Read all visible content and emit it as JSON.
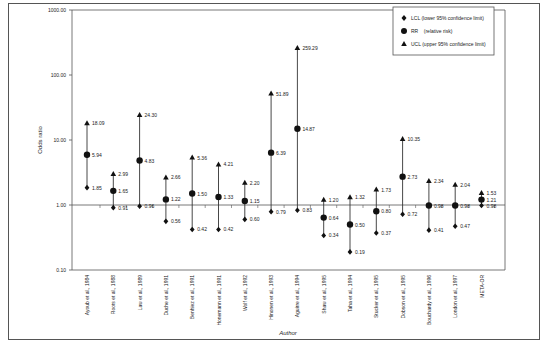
{
  "chart_data": {
    "type": "scatter",
    "subtype": "forest-plot (odds ratio with 95% CI)",
    "title": "",
    "xlabel": "Author",
    "ylabel": "Odds ratio",
    "yscale": "log",
    "ylim": [
      0.1,
      1000
    ],
    "yticks": [
      "0.10",
      "1.00",
      "10.00",
      "100.00",
      "1000.00"
    ],
    "legend": {
      "position": "top-right",
      "entries": [
        {
          "marker": "diamond",
          "label": "LCL (lower 95% confidence limit)"
        },
        {
          "marker": "circle",
          "label": "RR    (relative risk)"
        },
        {
          "marker": "triangle",
          "label": "UCL (upper 95% confidence limit)"
        }
      ]
    },
    "categories": [
      "Ayoub et al., 1984",
      "Roots et al., 1988",
      "Law et al., 1989",
      "Duche et al., 1991",
      "Benhiez et al., 1991",
      "Honemann et al., 1991",
      "Wolf et al., 1992",
      "Hinonen et al., 1993",
      "Aguirre et al., 1994",
      "Shaw et al., 1995",
      "Taha et al., 1994",
      "Stucker et al., 1995",
      "Dobson et al., 1995",
      "Bouchardy et al., 1996",
      "London et al., 1997",
      "META-OR"
    ],
    "series": [
      {
        "name": "LCL",
        "values": [
          1.85,
          0.91,
          0.96,
          0.56,
          0.42,
          0.42,
          0.6,
          0.79,
          0.83,
          0.34,
          0.19,
          0.37,
          0.72,
          0.41,
          0.47,
          0.98
        ]
      },
      {
        "name": "RR",
        "values": [
          5.94,
          1.65,
          4.83,
          1.22,
          1.5,
          1.33,
          1.15,
          6.39,
          14.87,
          0.64,
          0.5,
          0.8,
          2.73,
          0.98,
          0.98,
          1.21
        ]
      },
      {
        "name": "UCL",
        "values": [
          18.09,
          2.99,
          24.3,
          2.66,
          5.36,
          4.21,
          2.2,
          51.89,
          259.29,
          1.2,
          1.32,
          1.73,
          10.35,
          2.34,
          2.04,
          1.53
        ]
      }
    ],
    "labels": {
      "LCL": [
        "1.85",
        "0.91",
        "0.96",
        "0.56",
        "0.42",
        "0.42",
        "0.60",
        "0.79",
        "0.83",
        "0.34",
        "0.19",
        "0.37",
        "0.72",
        "0.41",
        "0.47",
        "0.98"
      ],
      "RR": [
        "5.94",
        "1.65",
        "4.83",
        "1.22",
        "1.50",
        "1.33",
        "1.15",
        "6.39",
        "14.87",
        "0.64",
        "0.50",
        "0.80",
        "2.73",
        "0.98",
        "0.98",
        "1.21"
      ],
      "UCL": [
        "18.09",
        "2.99",
        "24.30",
        "2.66",
        "5.36",
        "4.21",
        "2.20",
        "51.89",
        "259.29",
        "1.20",
        "1.32",
        "1.73",
        "10.35",
        "2.34",
        "2.04",
        "1.53"
      ]
    },
    "reference_line": 1.0,
    "grid": false
  },
  "colors": {
    "axis": "#555555",
    "marker": "#111111",
    "whisker": "#333333",
    "frame": "#555555"
  }
}
